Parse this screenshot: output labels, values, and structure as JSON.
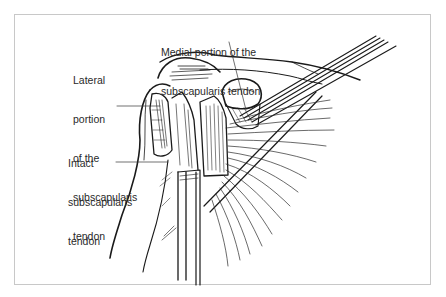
{
  "figure": {
    "type": "anatomical-illustration",
    "frame_color": "#c8c8c8",
    "line_color": "#1a1a1a"
  },
  "labels": {
    "medial": {
      "line1": "Medial portion of the",
      "line2": "subscapularis tendon"
    },
    "lateral": {
      "line1": "Lateral",
      "line2": "portion",
      "line3": "of the",
      "line4": "subscapularis",
      "line5": "tendon"
    },
    "intact": {
      "line1": "Intact",
      "line2": "subscapularis",
      "line3": "tendon"
    }
  }
}
